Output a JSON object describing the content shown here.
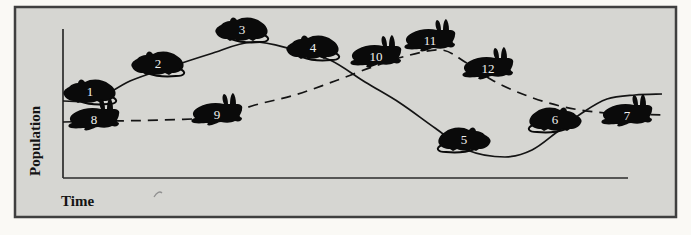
{
  "figure": {
    "colors": {
      "outer_background": "#faf9f5",
      "panel_background": "#d6d6d2",
      "frame": "#3f3f3f",
      "axis": "#2b2b2b",
      "curve": "#141414",
      "animal": "#0a0a0a",
      "marker_number": "#f0f0ee",
      "label": "#141414",
      "artifact": "#909090"
    },
    "scan_artifact_present": true
  },
  "chart_data": {
    "type": "line",
    "title": "",
    "xlabel": "Time",
    "ylabel": "Population",
    "x_ticks": [],
    "y_ticks": [],
    "grid": false,
    "legend": null,
    "series": [
      {
        "name": "mice population",
        "icon": "mouse-silhouette",
        "line_style": "solid",
        "points_px": [
          [
            63,
            101
          ],
          [
            95,
            100
          ],
          [
            130,
            81
          ],
          [
            170,
            67
          ],
          [
            210,
            54
          ],
          [
            252,
            42
          ],
          [
            295,
            50
          ],
          [
            330,
            60
          ],
          [
            365,
            82
          ],
          [
            400,
            103
          ],
          [
            435,
            128
          ],
          [
            467,
            150
          ],
          [
            505,
            157
          ],
          [
            532,
            150
          ],
          [
            557,
            132
          ],
          [
            582,
            113
          ],
          [
            607,
            99
          ],
          [
            635,
            95
          ],
          [
            662,
            94
          ]
        ]
      },
      {
        "name": "rabbit population",
        "icon": "rabbit-silhouette",
        "line_style": "dashed",
        "points_px": [
          [
            63,
            122
          ],
          [
            110,
            121
          ],
          [
            160,
            120
          ],
          [
            215,
            117
          ],
          [
            255,
            105
          ],
          [
            295,
            95
          ],
          [
            335,
            81
          ],
          [
            375,
            66
          ],
          [
            410,
            55
          ],
          [
            442,
            50
          ],
          [
            465,
            62
          ],
          [
            492,
            80
          ],
          [
            525,
            95
          ],
          [
            560,
            106
          ],
          [
            595,
            112
          ],
          [
            630,
            114
          ],
          [
            662,
            115
          ]
        ]
      }
    ],
    "markers": [
      {
        "label": "1",
        "species": "mouse",
        "facing": "left",
        "x": 90,
        "y": 91
      },
      {
        "label": "2",
        "species": "mouse",
        "facing": "left",
        "x": 158,
        "y": 63
      },
      {
        "label": "3",
        "species": "mouse",
        "facing": "left",
        "x": 242,
        "y": 29
      },
      {
        "label": "4",
        "species": "mouse",
        "facing": "left",
        "x": 313,
        "y": 47
      },
      {
        "label": "5",
        "species": "mouse",
        "facing": "right",
        "x": 464,
        "y": 139
      },
      {
        "label": "6",
        "species": "mouse",
        "facing": "right",
        "x": 555,
        "y": 119
      },
      {
        "label": "7",
        "species": "rabbit",
        "facing": "right",
        "x": 627,
        "y": 115
      },
      {
        "label": "8",
        "species": "rabbit",
        "facing": "right",
        "x": 94,
        "y": 119
      },
      {
        "label": "9",
        "species": "rabbit",
        "facing": "right",
        "x": 217,
        "y": 114
      },
      {
        "label": "10",
        "species": "rabbit",
        "facing": "right",
        "x": 376,
        "y": 56
      },
      {
        "label": "11",
        "species": "rabbit",
        "facing": "right",
        "x": 430,
        "y": 40
      },
      {
        "label": "12",
        "species": "rabbit",
        "facing": "right",
        "x": 488,
        "y": 68
      }
    ]
  }
}
